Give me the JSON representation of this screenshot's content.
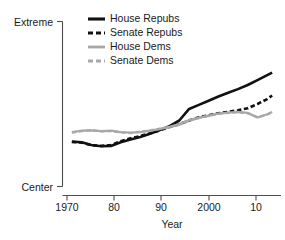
{
  "chart_data": {
    "type": "line",
    "title": "",
    "xlabel": "Year",
    "ylabel": "",
    "xlim": [
      1970,
      2013
    ],
    "ylim": [
      0,
      1
    ],
    "grid": false,
    "legend_position": "top-center",
    "y_tick_labels": [
      "Extreme",
      "Center"
    ],
    "y_tick_values": [
      1,
      0
    ],
    "x_tick_labels": [
      "1970",
      "80",
      "90",
      "2000",
      "10"
    ],
    "x_tick_values": [
      1970,
      1980,
      1990,
      2000,
      2010
    ],
    "series": [
      {
        "name": "House Repubs",
        "color": "#111111",
        "style": "solid",
        "x": [
          1971,
          1973,
          1975,
          1977,
          1979,
          1981,
          1983,
          1985,
          1987,
          1989,
          1991,
          1993,
          1995,
          1997,
          1999,
          2001,
          2003,
          2005,
          2007,
          2009,
          2011,
          2012
        ],
        "values": [
          0.272,
          0.268,
          0.252,
          0.244,
          0.246,
          0.268,
          0.285,
          0.3,
          0.32,
          0.342,
          0.366,
          0.4,
          0.47,
          0.495,
          0.52,
          0.545,
          0.568,
          0.59,
          0.615,
          0.645,
          0.675,
          0.69
        ]
      },
      {
        "name": "Senate Repubs",
        "color": "#111111",
        "style": "dashed",
        "x": [
          1971,
          1973,
          1975,
          1977,
          1979,
          1981,
          1983,
          1985,
          1987,
          1989,
          1991,
          1993,
          1995,
          1997,
          1999,
          2001,
          2003,
          2005,
          2007,
          2009,
          2011,
          2012
        ],
        "values": [
          0.27,
          0.266,
          0.25,
          0.246,
          0.252,
          0.274,
          0.292,
          0.306,
          0.322,
          0.34,
          0.36,
          0.378,
          0.4,
          0.42,
          0.432,
          0.444,
          0.452,
          0.462,
          0.474,
          0.5,
          0.53,
          0.552
        ]
      },
      {
        "name": "House Dems",
        "color": "#a8a8a8",
        "style": "solid",
        "x": [
          1971,
          1973,
          1975,
          1977,
          1979,
          1981,
          1983,
          1985,
          1987,
          1989,
          1991,
          1993,
          1995,
          1997,
          1999,
          2001,
          2003,
          2005,
          2007,
          2009,
          2011,
          2012
        ],
        "values": [
          0.33,
          0.338,
          0.34,
          0.336,
          0.338,
          0.33,
          0.326,
          0.33,
          0.338,
          0.348,
          0.362,
          0.378,
          0.402,
          0.418,
          0.43,
          0.442,
          0.448,
          0.452,
          0.446,
          0.418,
          0.438,
          0.452
        ]
      },
      {
        "name": "Senate Dems",
        "color": "#a8a8a8",
        "style": "dashed",
        "x": [
          1971,
          1973,
          1975,
          1977,
          1979,
          1981,
          1983,
          1985,
          1987,
          1989,
          1991,
          1993,
          1995,
          1997,
          1999,
          2001,
          2003,
          2005,
          2007,
          2009,
          2011,
          2012
        ],
        "values": [
          0.326,
          0.336,
          0.342,
          0.334,
          0.336,
          0.328,
          0.324,
          0.332,
          0.34,
          0.35,
          0.36,
          0.374,
          0.398,
          0.414,
          0.428,
          0.44,
          0.446,
          0.45,
          0.444,
          0.42,
          0.436,
          0.45
        ]
      }
    ]
  },
  "legend": {
    "items": [
      {
        "label": "House Repubs"
      },
      {
        "label": "Senate Repubs"
      },
      {
        "label": "House Dems"
      },
      {
        "label": "Senate Dems"
      }
    ]
  }
}
